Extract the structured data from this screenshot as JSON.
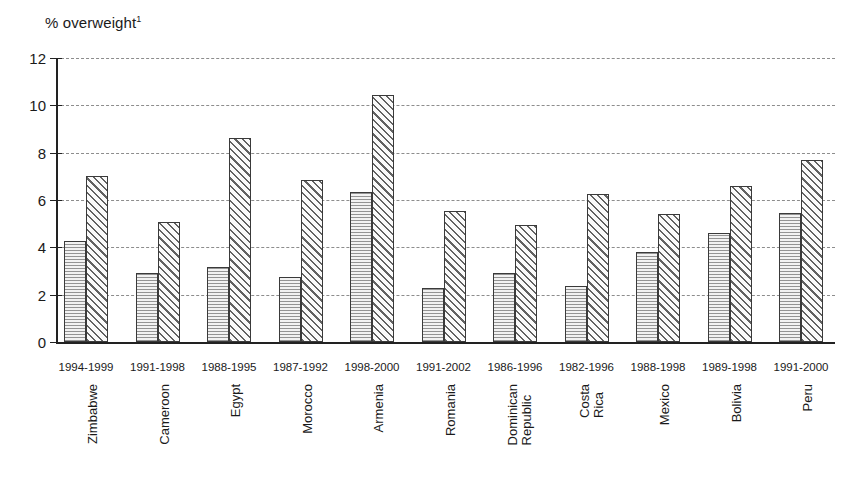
{
  "chart_data": {
    "type": "bar",
    "title": "% overweight",
    "title_superscript": "1",
    "xlabel": "",
    "ylabel": "% overweight",
    "ylim": [
      0,
      12
    ],
    "ytick_step": 2,
    "yticks": [
      "12",
      "10",
      "8",
      "6",
      "4",
      "2",
      "0"
    ],
    "grid": true,
    "legend": "none",
    "categories": [
      "Zimbabwe",
      "Cameroon",
      "Egypt",
      "Morocco",
      "Armenia",
      "Romania",
      "Dominican Republic",
      "Costa Rica",
      "Mexico",
      "Bolivia",
      "Peru"
    ],
    "category_lines": [
      [
        "Zimbabwe"
      ],
      [
        "Cameroon"
      ],
      [
        "Egypt"
      ],
      [
        "Morocco"
      ],
      [
        "Armenia"
      ],
      [
        "Romania"
      ],
      [
        "Dominican",
        "Republic"
      ],
      [
        "Costa",
        "Rica"
      ],
      [
        "Mexico"
      ],
      [
        "Bolivia"
      ],
      [
        "Peru"
      ]
    ],
    "periods": [
      "1994-1999",
      "1991-1998",
      "1988-1995",
      "1987-1992",
      "1998-2000",
      "1991-2002",
      "1986-1996",
      "1982-1996",
      "1988-1998",
      "1989-1998",
      "1991-2000"
    ],
    "series": [
      {
        "name": "earlier survey",
        "pattern": "horizontal-stipple",
        "values": [
          4.25,
          2.9,
          3.15,
          2.75,
          6.35,
          2.3,
          2.9,
          2.35,
          3.8,
          4.6,
          5.45
        ]
      },
      {
        "name": "later survey",
        "pattern": "diagonal-hatch",
        "values": [
          7.0,
          5.05,
          8.6,
          6.85,
          10.45,
          5.55,
          4.95,
          6.25,
          5.4,
          6.6,
          7.7
        ]
      }
    ]
  },
  "colors": {
    "axis": "#222222",
    "grid": "#8d8d8d",
    "bar_outline": "#3a3a3a",
    "series1_fill": "#f2f2f2",
    "series2_fill": "#fafafa",
    "background": "#ffffff"
  }
}
